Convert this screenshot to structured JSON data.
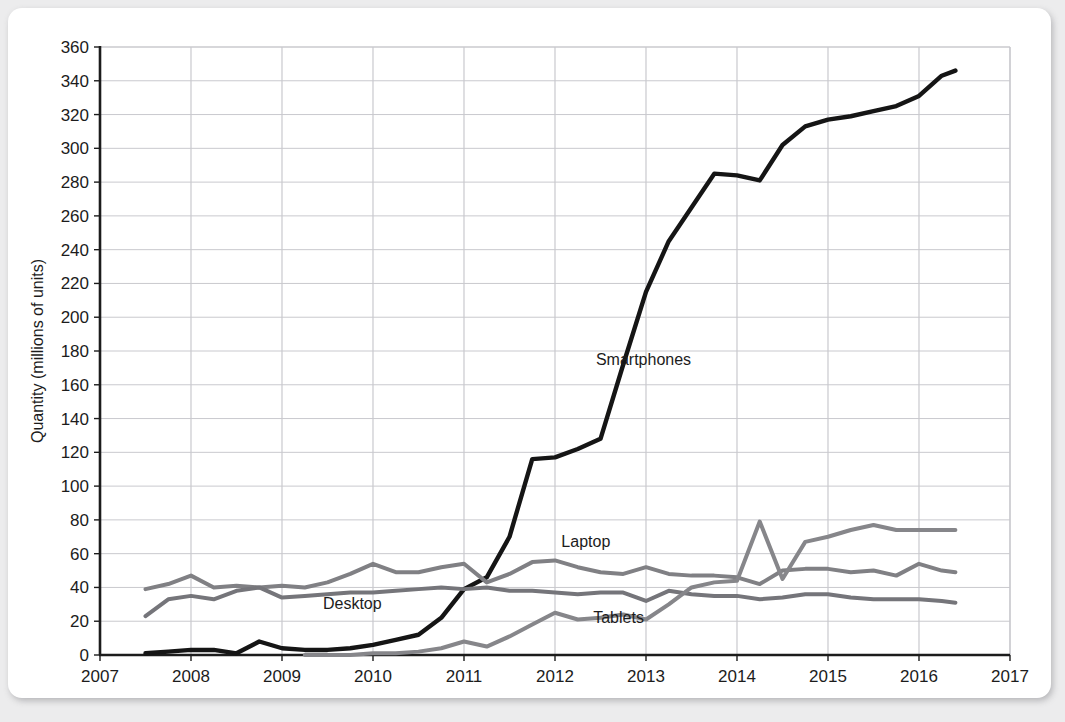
{
  "chart_data": {
    "type": "line",
    "title": "",
    "subtitle": "",
    "xlabel": "",
    "ylabel": "Quantity (millions of units)",
    "xlim": [
      2007,
      2017
    ],
    "ylim": [
      0,
      360
    ],
    "grid": true,
    "legend_position": "inline-annotations",
    "x_ticks": [
      "2007",
      "2008",
      "2009",
      "2010",
      "2011",
      "2012",
      "2013",
      "2014",
      "2015",
      "2016",
      "2017"
    ],
    "y_ticks": [
      "0",
      "20",
      "40",
      "60",
      "80",
      "100",
      "120",
      "140",
      "160",
      "180",
      "200",
      "220",
      "240",
      "260",
      "280",
      "300",
      "320",
      "340",
      "360"
    ],
    "colors": {
      "smartphones": "#151515",
      "laptop": "#808084",
      "desktop": "#75757a",
      "tablets": "#86868a",
      "grid": "#c9c9ce",
      "axis": "#1c1c1c",
      "card": "#ffffff",
      "page_background": "#ececed"
    },
    "series": [
      {
        "name": "Smartphones",
        "color": "#151515",
        "label_x": 2012.45,
        "label_y": 172,
        "x": [
          2007.5,
          2007.75,
          2008.0,
          2008.25,
          2008.5,
          2008.75,
          2009.0,
          2009.25,
          2009.5,
          2009.75,
          2010.0,
          2010.25,
          2010.5,
          2010.75,
          2011.0,
          2011.25,
          2011.5,
          2011.75,
          2012.0,
          2012.25,
          2012.5,
          2012.75,
          2013.0,
          2013.25,
          2013.5,
          2013.75,
          2014.0,
          2014.25,
          2014.5,
          2014.75,
          2015.0,
          2015.25,
          2015.5,
          2015.75,
          2016.0,
          2016.25,
          2016.4
        ],
        "y": [
          1,
          2,
          3,
          3,
          1,
          8,
          4,
          3,
          3,
          4,
          6,
          9,
          12,
          22,
          39,
          46,
          70,
          116,
          117,
          122,
          128,
          172,
          215,
          245,
          265,
          285,
          284,
          281,
          302,
          313,
          317,
          319,
          322,
          325,
          331,
          343,
          346
        ]
      },
      {
        "name": "Laptop",
        "color": "#808084",
        "label_x": 2012.07,
        "label_y": 64,
        "x": [
          2007.5,
          2007.75,
          2008.0,
          2008.25,
          2008.5,
          2008.75,
          2009.0,
          2009.25,
          2009.5,
          2009.75,
          2010.0,
          2010.25,
          2010.5,
          2010.75,
          2011.0,
          2011.25,
          2011.5,
          2011.75,
          2012.0,
          2012.25,
          2012.5,
          2012.75,
          2013.0,
          2013.25,
          2013.5,
          2013.75,
          2014.0,
          2014.25,
          2014.5,
          2014.75,
          2015.0,
          2015.25,
          2015.5,
          2015.75,
          2016.0,
          2016.25,
          2016.4
        ],
        "y": [
          39,
          42,
          47,
          40,
          41,
          40,
          41,
          40,
          43,
          48,
          54,
          49,
          49,
          52,
          54,
          43,
          48,
          55,
          56,
          52,
          49,
          48,
          52,
          48,
          47,
          47,
          46,
          42,
          50,
          51,
          51,
          49,
          50,
          47,
          54,
          50,
          49
        ]
      },
      {
        "name": "Desktop",
        "color": "#75757a",
        "label_x": 2009.45,
        "label_y": 27,
        "x": [
          2007.5,
          2007.75,
          2008.0,
          2008.25,
          2008.5,
          2008.75,
          2009.0,
          2009.25,
          2009.5,
          2009.75,
          2010.0,
          2010.25,
          2010.5,
          2010.75,
          2011.0,
          2011.25,
          2011.5,
          2011.75,
          2012.0,
          2012.25,
          2012.5,
          2012.75,
          2013.0,
          2013.25,
          2013.5,
          2013.75,
          2014.0,
          2014.25,
          2014.5,
          2014.75,
          2015.0,
          2015.25,
          2015.5,
          2015.75,
          2016.0,
          2016.25,
          2016.4
        ],
        "y": [
          23,
          33,
          35,
          33,
          38,
          40,
          34,
          35,
          36,
          37,
          37,
          38,
          39,
          40,
          39,
          40,
          38,
          38,
          37,
          36,
          37,
          37,
          32,
          38,
          36,
          35,
          35,
          33,
          34,
          36,
          36,
          34,
          33,
          33,
          33,
          32,
          31
        ]
      },
      {
        "name": "Tablets",
        "color": "#86868a",
        "label_x": 2012.42,
        "label_y": 19,
        "x": [
          2009.25,
          2009.5,
          2009.75,
          2010.0,
          2010.25,
          2010.5,
          2010.75,
          2011.0,
          2011.25,
          2011.5,
          2011.75,
          2012.0,
          2012.25,
          2012.5,
          2012.75,
          2013.0,
          2013.25,
          2013.5,
          2013.75,
          2014.0,
          2014.25,
          2014.5,
          2014.75,
          2015.0,
          2015.25,
          2015.5,
          2015.75,
          2016.0,
          2016.25,
          2016.4
        ],
        "y": [
          0,
          0,
          0,
          1,
          1,
          2,
          4,
          8,
          5,
          11,
          18,
          25,
          21,
          22,
          24,
          21,
          30,
          40,
          43,
          44,
          79,
          45,
          67,
          70,
          74,
          77,
          74,
          74,
          74,
          74
        ]
      }
    ]
  }
}
